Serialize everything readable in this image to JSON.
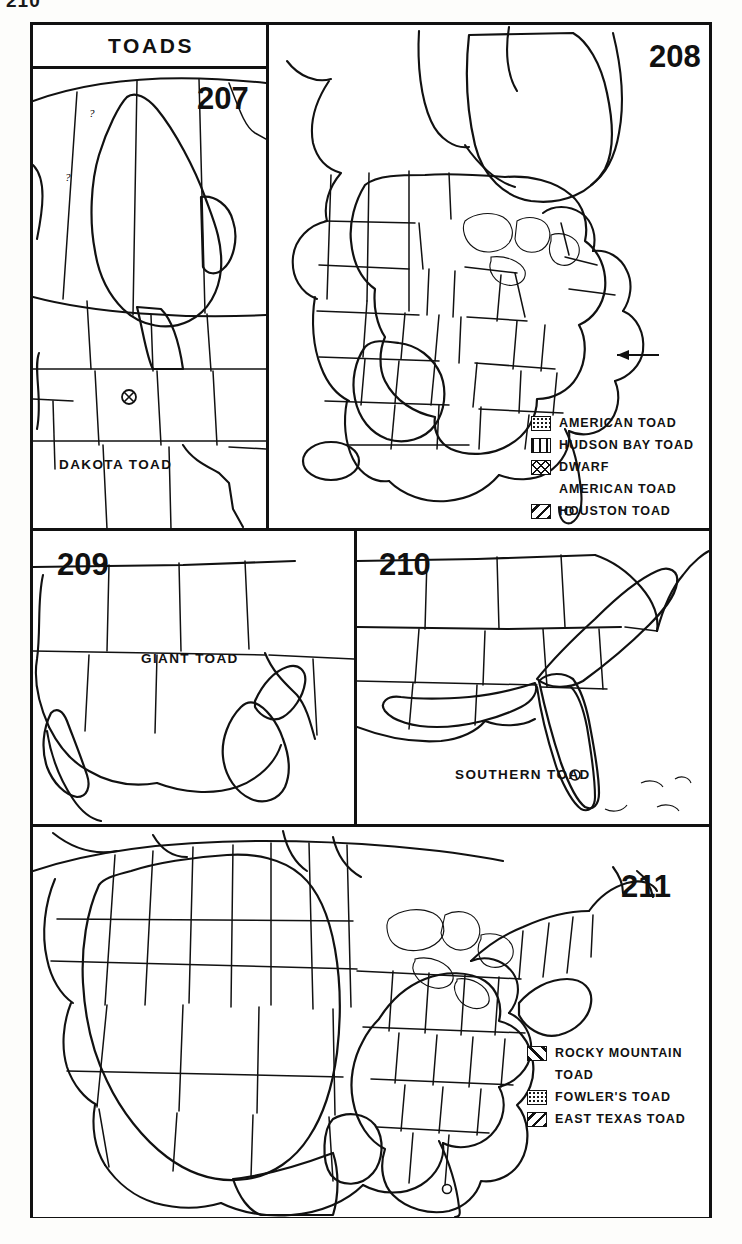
{
  "page": {
    "number": "210"
  },
  "plate": {
    "title": "TOADS"
  },
  "panels": [
    {
      "id": "panel-207",
      "number": "207",
      "caption": "DAKOTA TOAD",
      "pattern": "crosshatch",
      "markers": [
        "isolated-population-symbol",
        "?",
        "?"
      ]
    },
    {
      "id": "panel-208",
      "number": "208",
      "caption": "",
      "legend": [
        {
          "label": "AMERICAN TOAD",
          "pattern": "stipple",
          "indent": false
        },
        {
          "label": "HUDSON BAY TOAD",
          "pattern": "vertical",
          "indent": false
        },
        {
          "label": "DWARF",
          "pattern": "crosshatch",
          "indent": false
        },
        {
          "label": "AMERICAN TOAD",
          "pattern": "none",
          "indent": true
        },
        {
          "label": "HOUSTON TOAD",
          "pattern": "diagonal-right",
          "indent": false
        }
      ],
      "markers": [
        "range-arrow"
      ]
    },
    {
      "id": "panel-209",
      "number": "209",
      "caption": "GIANT TOAD",
      "pattern": "stipple"
    },
    {
      "id": "panel-210",
      "number": "210",
      "caption": "SOUTHERN TOAD",
      "pattern": "crosshatch"
    },
    {
      "id": "panel-211",
      "number": "211",
      "caption": "",
      "legend": [
        {
          "label": "ROCKY MOUNTAIN",
          "pattern": "diagonal-left",
          "indent": false
        },
        {
          "label": "TOAD",
          "pattern": "none",
          "indent": true
        },
        {
          "label": "FOWLER'S TOAD",
          "pattern": "stipple",
          "indent": false
        },
        {
          "label": "EAST TEXAS TOAD",
          "pattern": "diagonal-right",
          "indent": false
        }
      ]
    }
  ]
}
